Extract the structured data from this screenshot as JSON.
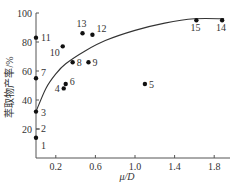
{
  "chart_data": {
    "type": "scatter",
    "title": "",
    "xlabel": "μ/D",
    "ylabel": "萃取物产率/%",
    "xlim": [
      0,
      2.0
    ],
    "ylim": [
      0,
      100
    ],
    "x_ticks": [
      "0.2",
      "0.6",
      "1.0",
      "1.4",
      "1.8"
    ],
    "y_ticks": [
      "20",
      "40",
      "60",
      "80",
      "100"
    ],
    "grid": false,
    "legend": null,
    "points": [
      {
        "label": "1",
        "x": 0.0,
        "y": 14
      },
      {
        "label": "2",
        "x": 0.0,
        "y": 20
      },
      {
        "label": "3",
        "x": 0.0,
        "y": 32
      },
      {
        "label": "4",
        "x": 0.28,
        "y": 48
      },
      {
        "label": "5",
        "x": 1.1,
        "y": 51
      },
      {
        "label": "6",
        "x": 0.3,
        "y": 51
      },
      {
        "label": "7",
        "x": 0.0,
        "y": 55
      },
      {
        "label": "8",
        "x": 0.37,
        "y": 66
      },
      {
        "label": "9",
        "x": 0.53,
        "y": 66
      },
      {
        "label": "10",
        "x": 0.27,
        "y": 77
      },
      {
        "label": "11",
        "x": 0.0,
        "y": 83
      },
      {
        "label": "12",
        "x": 0.57,
        "y": 85
      },
      {
        "label": "13",
        "x": 0.47,
        "y": 86
      },
      {
        "label": "14",
        "x": 1.88,
        "y": 95
      },
      {
        "label": "15",
        "x": 1.62,
        "y": 95
      }
    ],
    "trend_curve": {
      "type": "smooth fit",
      "x": [
        0.0,
        0.1,
        0.2,
        0.3,
        0.5,
        0.7,
        1.0,
        1.3,
        1.6,
        1.9
      ],
      "y": [
        32,
        48,
        58,
        65,
        74,
        81,
        88,
        93,
        96,
        96
      ]
    },
    "colors": {
      "points": "#111111",
      "curve": "#333333",
      "axes": "#555555"
    }
  }
}
